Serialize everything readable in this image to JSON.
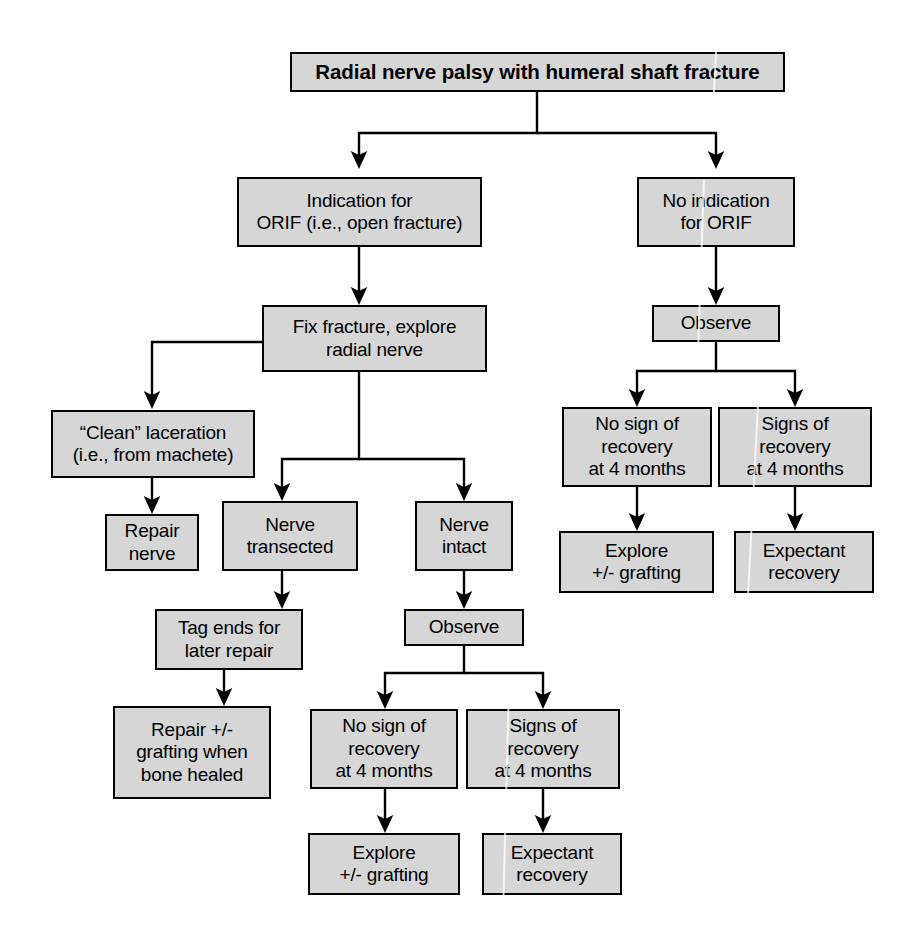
{
  "diagram": {
    "title": "Radial nerve palsy with humeral shaft fracture",
    "type": "flowchart",
    "box_fill_color": "#d6d6d6",
    "box_border_color": "#000000",
    "background_color": "#ffffff",
    "nodes": {
      "root": "Radial nerve palsy with humeral shaft fracture",
      "orif_yes": "Indication for\nORIF (i.e., open fracture)",
      "orif_no": "No indication\nfor ORIF",
      "fix_explore": "Fix fracture, explore\nradial nerve",
      "observe_right": "Observe",
      "clean_laceration": "“Clean” laceration\n(i.e., from machete)",
      "nerve_transected": "Nerve\ntransected",
      "nerve_intact": "Nerve\nintact",
      "right_no_recovery": "No sign of\nrecovery\nat 4 months",
      "right_signs_recovery": "Signs of\nrecovery\nat 4 months",
      "repair_nerve": "Repair\nnerve",
      "right_explore": "Explore\n+/- grafting",
      "right_expectant": "Expectant\nrecovery",
      "tag_ends": "Tag ends for\nlater repair",
      "observe_mid": "Observe",
      "repair_grafting": "Repair +/-\ngrafting when\nbone healed",
      "mid_no_recovery": "No sign of\nrecovery\nat 4 months",
      "mid_signs_recovery": "Signs of\nrecovery\nat 4 months",
      "mid_explore": "Explore\n+/- grafting",
      "mid_expectant": "Expectant\nrecovery"
    },
    "edges": [
      {
        "from": "root",
        "to": "orif_yes"
      },
      {
        "from": "root",
        "to": "orif_no"
      },
      {
        "from": "orif_yes",
        "to": "fix_explore"
      },
      {
        "from": "orif_no",
        "to": "observe_right"
      },
      {
        "from": "fix_explore",
        "to": "clean_laceration"
      },
      {
        "from": "fix_explore",
        "to": "nerve_transected"
      },
      {
        "from": "fix_explore",
        "to": "nerve_intact"
      },
      {
        "from": "observe_right",
        "to": "right_no_recovery"
      },
      {
        "from": "observe_right",
        "to": "right_signs_recovery"
      },
      {
        "from": "clean_laceration",
        "to": "repair_nerve"
      },
      {
        "from": "nerve_transected",
        "to": "tag_ends"
      },
      {
        "from": "nerve_intact",
        "to": "observe_mid"
      },
      {
        "from": "right_no_recovery",
        "to": "right_explore"
      },
      {
        "from": "right_signs_recovery",
        "to": "right_expectant"
      },
      {
        "from": "tag_ends",
        "to": "repair_grafting"
      },
      {
        "from": "observe_mid",
        "to": "mid_no_recovery"
      },
      {
        "from": "observe_mid",
        "to": "mid_signs_recovery"
      },
      {
        "from": "mid_no_recovery",
        "to": "mid_explore"
      },
      {
        "from": "mid_signs_recovery",
        "to": "mid_expectant"
      }
    ]
  }
}
